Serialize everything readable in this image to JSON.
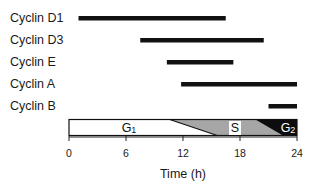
{
  "chart_data": {
    "type": "bar",
    "subtype": "gantt-timeline",
    "title": "",
    "xlabel": "Time (h)",
    "ylabel": "",
    "xlim": [
      0,
      24
    ],
    "xticks": [
      0,
      6,
      12,
      18,
      24
    ],
    "xtick_labels": [
      "0",
      "6",
      "12",
      "18",
      "24"
    ],
    "grid": false,
    "legend": null,
    "categories": [
      "Cyclin D1",
      "Cyclin D3",
      "Cyclin E",
      "Cyclin A",
      "Cyclin B"
    ],
    "series": [
      {
        "name": "Cyclin D1",
        "start": 1,
        "end": 16.5
      },
      {
        "name": "Cyclin D3",
        "start": 7.5,
        "end": 20.5
      },
      {
        "name": "Cyclin E",
        "start": 10.3,
        "end": 17.3
      },
      {
        "name": "Cyclin A",
        "start": 11.8,
        "end": 24
      },
      {
        "name": "Cyclin B",
        "start": 21,
        "end": 24
      }
    ],
    "phases": [
      {
        "name": "G1",
        "label_main": "G",
        "label_sub": "1",
        "start_top": 0,
        "end_top": 10.6,
        "end_bottom": 15.6,
        "color": "#ffffff"
      },
      {
        "name": "S",
        "label_main": "S",
        "label_sub": "",
        "start_top": 10.6,
        "end_top": 19.6,
        "end_bottom": 22.5,
        "color": "#a6a6a6"
      },
      {
        "name": "G2",
        "label_main": "G",
        "label_sub": "2",
        "start_top": 19.6,
        "end_top": 24,
        "end_bottom": 24,
        "color": "#0d0d0d"
      }
    ],
    "colors": {
      "bar": "#111111",
      "axis": "#222222",
      "g1": "#ffffff",
      "s": "#a6a6a6",
      "g2": "#0d0d0d"
    }
  }
}
